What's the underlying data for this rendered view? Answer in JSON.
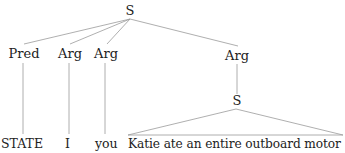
{
  "tree": {
    "root": {
      "label": "S"
    },
    "children": [
      {
        "label": "Pred",
        "leaf": "STATE"
      },
      {
        "label": "Arg",
        "leaf": "I"
      },
      {
        "label": "Arg",
        "leaf": "you"
      },
      {
        "label": "Arg",
        "child": {
          "label": "S",
          "leaf": "Katie ate an entire outboard motor",
          "leaf_style": "triangle"
        }
      }
    ]
  },
  "colors": {
    "line": "#9a9a9a",
    "text": "#222222"
  }
}
